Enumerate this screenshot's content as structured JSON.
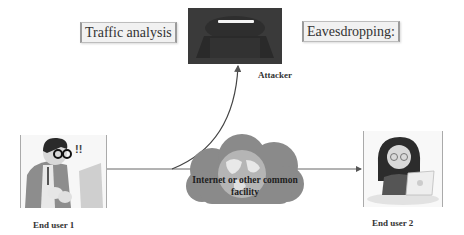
{
  "diagram": {
    "type": "network-attack",
    "labels": {
      "traffic_analysis": "Traffic analysis",
      "eavesdropping": "Eavesdropping:",
      "attacker": "Attacker",
      "cloud_line1": "Internet or other common",
      "cloud_line2": "facility",
      "end_user_1": "End user 1",
      "end_user_2": "End user 2"
    },
    "nodes": [
      {
        "id": "attacker",
        "icon": "attacker-icon"
      },
      {
        "id": "end-user-1",
        "icon": "man-at-laptop-icon"
      },
      {
        "id": "end-user-2",
        "icon": "woman-at-laptop-icon"
      },
      {
        "id": "cloud",
        "icon": "cloud-globe-icon"
      }
    ],
    "edges": [
      {
        "from": "end-user-1",
        "to": "end-user-2",
        "style": "arrow"
      },
      {
        "from": "cloud",
        "to": "attacker",
        "style": "curved-arrow"
      }
    ],
    "colors": {
      "cloud": "#8a8a8a",
      "attacker_bg": "#3a3a3a",
      "line": "#555555"
    }
  }
}
